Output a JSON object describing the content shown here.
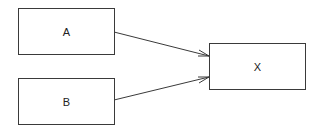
{
  "diagram": {
    "nodes": [
      {
        "id": "A",
        "label": "A"
      },
      {
        "id": "B",
        "label": "B"
      },
      {
        "id": "X",
        "label": "X"
      }
    ],
    "edges": [
      {
        "from": "A",
        "to": "X"
      },
      {
        "from": "B",
        "to": "X"
      }
    ],
    "colors": {
      "stroke": "#3a3a3a",
      "background": "#ffffff"
    }
  }
}
